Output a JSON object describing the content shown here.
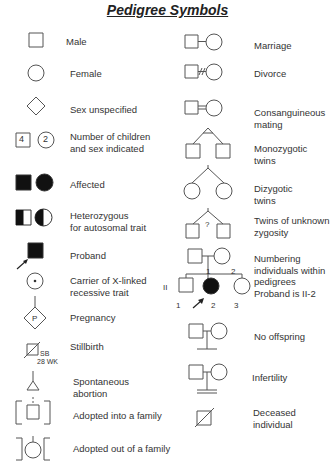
{
  "title": "Pedigree Symbols",
  "left_column": [
    {
      "label": "Male"
    },
    {
      "label": "Female"
    },
    {
      "label": "Sex unspecified"
    },
    {
      "label": "Number of children\nand sex indicated",
      "male_count": "4",
      "female_count": "2"
    },
    {
      "label": "Affected"
    },
    {
      "label": "Heterozygous\nfor autosomal trait"
    },
    {
      "label": "Proband"
    },
    {
      "label": "Carrier of X-linked\nrecessive trait"
    },
    {
      "label": "Pregnancy",
      "symbol_text": "P"
    },
    {
      "label": "Stillbirth",
      "annotation_1": "SB",
      "annotation_2": "28 WK"
    },
    {
      "label": "Spontaneous\nabortion"
    },
    {
      "label": "Adopted into a family"
    },
    {
      "label": "Adopted out of a family"
    }
  ],
  "right_column": [
    {
      "label": "Marriage"
    },
    {
      "label": "Divorce"
    },
    {
      "label": "Consanguineous\nmating"
    },
    {
      "label": "Monozygotic\ntwins"
    },
    {
      "label": "Dizygotic\ntwins"
    },
    {
      "label": "Twins of unknown\nzygosity",
      "symbol_text": "?"
    },
    {
      "label": "Numbering\nindividuals within\npedigrees\nProband is II-2",
      "generation_1": "I",
      "generation_2": "II",
      "gen1_numbers": [
        "1",
        "2"
      ],
      "gen2_numbers": [
        "1",
        "2",
        "3"
      ]
    },
    {
      "label": "No offspring"
    },
    {
      "label": "Infertility"
    },
    {
      "label": "Deceased\nindividual"
    }
  ],
  "colors": {
    "stroke": "#555555",
    "fill_affected": "#111111",
    "text": "#333333"
  }
}
